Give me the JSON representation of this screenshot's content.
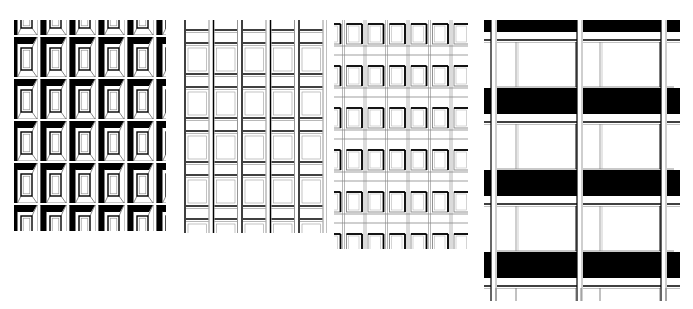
{
  "figure": {
    "background": "#ffffff",
    "ink": "#000000",
    "panels": [
      {
        "id": "facade-1",
        "style": "deep-set punched windows with heavy black shadow poche (bevelled reveals)",
        "bounds": {
          "x": 14,
          "y": 20,
          "w": 151,
          "h": 210
        },
        "columns": 5,
        "rows": 5,
        "module": {
          "w": 29,
          "h": 42
        }
      },
      {
        "id": "facade-2",
        "style": "thin line grid of continuous vertical mullions with paired horizontal spandrel bands",
        "bounds": {
          "x": 182,
          "y": 20,
          "w": 144,
          "h": 212
        },
        "columns": 5,
        "rows": 5,
        "module": {
          "w": 28.5,
          "h": 44
        }
      },
      {
        "id": "facade-3",
        "style": "regular grid of framed windows with light shadow on left/top edges",
        "bounds": {
          "x": 335,
          "y": 20,
          "w": 132,
          "h": 228
        },
        "columns": 6,
        "rows": 6,
        "module": {
          "w": 21.5,
          "h": 42
        }
      },
      {
        "id": "facade-4",
        "style": "large glazed bays with solid black spandrel bands and slender double columns",
        "bounds": {
          "x": 484,
          "y": 20,
          "w": 197,
          "h": 280
        },
        "bays": 2,
        "floors": 3,
        "spandrel_band_color": "#000000"
      }
    ]
  }
}
